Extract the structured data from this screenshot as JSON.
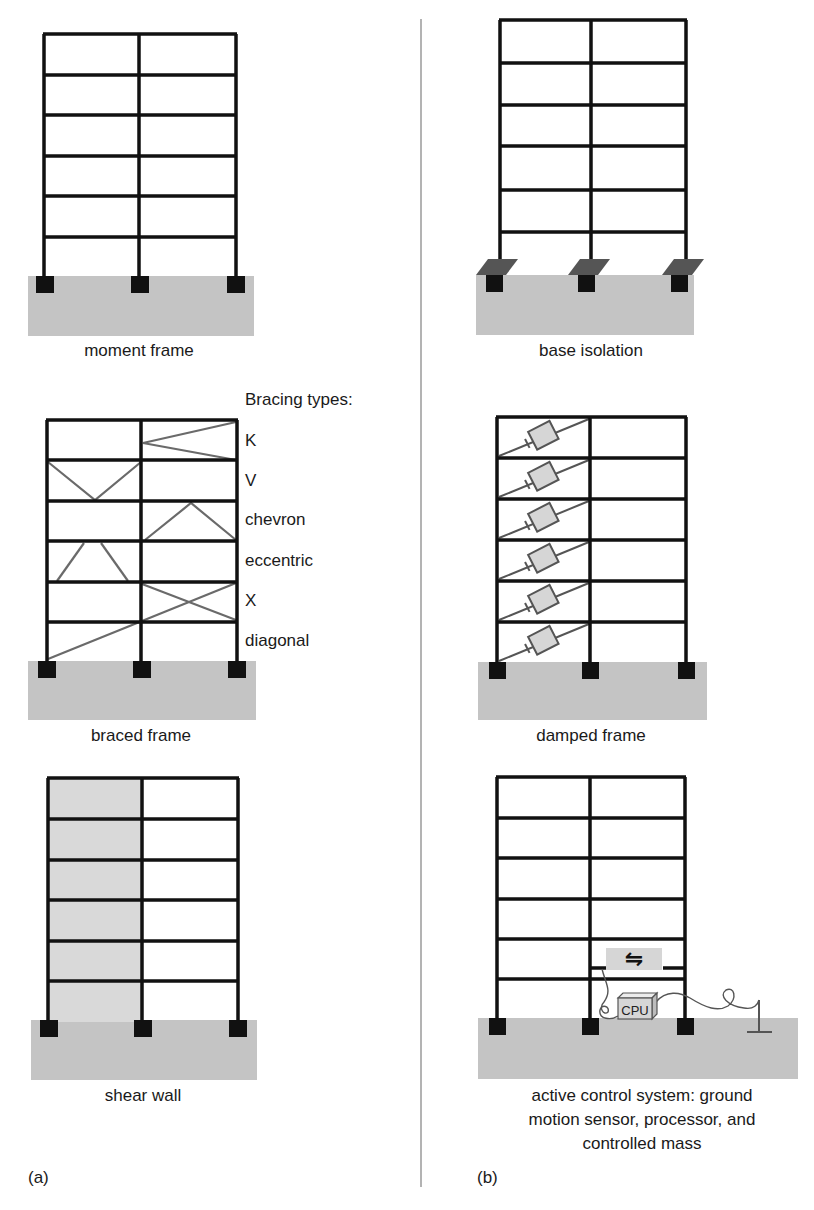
{
  "panels": {
    "a": {
      "label": "(a)",
      "diagrams": [
        {
          "caption": "moment frame"
        },
        {
          "caption": "braced frame"
        },
        {
          "caption": "shear wall"
        }
      ],
      "bracing": {
        "title": "Bracing types:",
        "types": [
          "K",
          "V",
          "chevron",
          "eccentric",
          "X",
          "diagonal"
        ]
      }
    },
    "b": {
      "label": "(b)",
      "diagrams": [
        {
          "caption": "base isolation"
        },
        {
          "caption": "damped frame"
        },
        {
          "caption_lines": [
            "active control system: ground",
            "motion sensor, processor, and",
            "controlled mass"
          ]
        }
      ],
      "cpu_label": "CPU",
      "mass_symbol": "⇋"
    }
  },
  "colors": {
    "frame": "#111111",
    "ground": "#c4c4c4",
    "brace": "#6a6a6a",
    "isolator": "#555555",
    "wall": "#d9d9d9",
    "device": "#d6d6d6",
    "divider": "#999999"
  }
}
